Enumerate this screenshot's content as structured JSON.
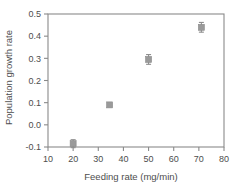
{
  "chart_data": {
    "type": "scatter",
    "title": "",
    "xlabel": "Feeding rate (mg/min)",
    "ylabel": "Population growth rate",
    "xlim": [
      10,
      80
    ],
    "ylim": [
      -0.1,
      0.5
    ],
    "xticks": [
      10,
      20,
      30,
      40,
      50,
      60,
      70,
      80
    ],
    "xticklabels": [
      "10",
      "20",
      "30",
      "40",
      "50",
      "60",
      "70",
      "80"
    ],
    "yticks": [
      -0.1,
      0.0,
      0.1,
      0.2,
      0.3,
      0.4,
      0.5
    ],
    "yticklabels": [
      "-0.1",
      "0.0",
      "0.1",
      "0.2",
      "0.3",
      "0.4",
      "0.5"
    ],
    "grid": false,
    "legend": null,
    "marker": "square",
    "marker_color": "#9a9a9a",
    "axis_color": "#8a8a8a",
    "frame": "box",
    "points": [
      {
        "x": 20.0,
        "y": -0.085,
        "yerr": 0.018
      },
      {
        "x": 34.5,
        "y": 0.09,
        "yerr": 0.004
      },
      {
        "x": 50.0,
        "y": 0.295,
        "yerr": 0.022
      },
      {
        "x": 71.0,
        "y": 0.44,
        "yerr": 0.022
      }
    ]
  }
}
